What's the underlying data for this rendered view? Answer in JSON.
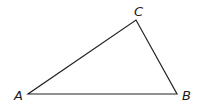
{
  "diagram": {
    "type": "triangle",
    "stroke_color": "#222222",
    "background": "#ffffff",
    "vertices": [
      {
        "label": "A",
        "x": 28,
        "y": 94,
        "label_x": 14,
        "label_y": 100
      },
      {
        "label": "B",
        "x": 177,
        "y": 94,
        "label_x": 182,
        "label_y": 100
      },
      {
        "label": "C",
        "x": 136,
        "y": 20,
        "label_x": 134,
        "label_y": 16
      }
    ]
  }
}
